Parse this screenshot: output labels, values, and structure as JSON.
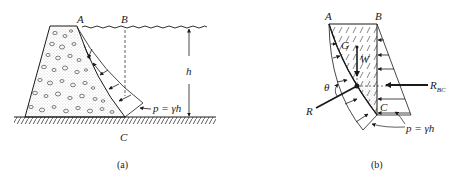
{
  "figure": {
    "panel_a": {
      "caption": "(a)",
      "labels": {
        "A": "A",
        "B": "B",
        "C": "C",
        "h": "h",
        "pressure": "p = γh"
      },
      "elements": [
        "concrete-dam",
        "water-surface",
        "ground-hatching",
        "pressure-distribution",
        "height-dimension",
        "dashed-vertical-BC"
      ]
    },
    "panel_b": {
      "caption": "(b)",
      "labels": {
        "A": "A",
        "B": "B",
        "C": "C",
        "G": "G",
        "W": "W",
        "theta": "θ",
        "R": "R",
        "R_BC_main": "R",
        "R_BC_sub": "BC",
        "pressure": "p = γh"
      },
      "elements": [
        "free-body-water-region",
        "weight-arrow",
        "resultant-R",
        "horizontal-force-RBC",
        "curved-face-pressure",
        "vertical-face-pressure"
      ]
    },
    "colors": {
      "ink": "#1a1a1a",
      "background": "#ffffff"
    }
  }
}
